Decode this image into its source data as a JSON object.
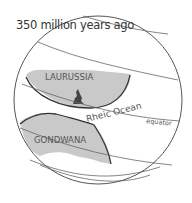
{
  "title": "350 million years ago",
  "labels": {
    "laurussia": "LAURUSSIA",
    "gondwana": "GONDWANA",
    "ocean": "Rheic Ocean",
    "equator": "equator"
  },
  "colors": {
    "continent_fill": "#c9c9c9",
    "outline": "#444444",
    "text": "#555555"
  }
}
